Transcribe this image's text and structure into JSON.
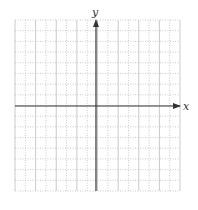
{
  "figure": {
    "type": "coordinate-grid",
    "x_axis_label": "x",
    "y_axis_label": "y",
    "grid": {
      "columns": 16,
      "rows": 16,
      "left": 15,
      "top": 20,
      "right": 180,
      "bottom": 191,
      "origin_x": 96,
      "origin_y": 106
    },
    "colors": {
      "grid_line": "#bdbdbd",
      "axis": "#333333",
      "background": "#ffffff"
    }
  }
}
